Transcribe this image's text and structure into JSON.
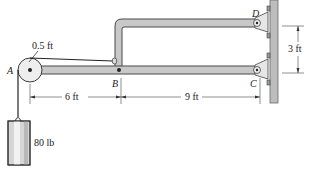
{
  "figure": {
    "points": {
      "A": "A",
      "B": "B",
      "C": "C",
      "D": "D"
    },
    "dimensions": {
      "pulley_radius": "0.5 ft",
      "AB": "6 ft",
      "BC": "9 ft",
      "CD_vertical": "3 ft"
    },
    "load": {
      "weight": "80 lb"
    },
    "colors": {
      "member_fill": "#c8c8c8",
      "member_stroke": "#4a4a4a",
      "wall_fill": "#bdbdbd",
      "ink": "#222222"
    }
  }
}
